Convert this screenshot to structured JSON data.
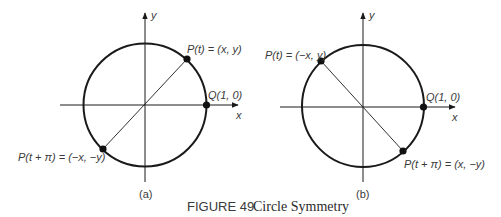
{
  "figure": {
    "number_label": "FIGURE 49",
    "title": "Circle Symmetry"
  },
  "panels": [
    {
      "id": "a",
      "caption": "(a)",
      "x_axis_label": "x",
      "y_axis_label": "y",
      "q_point_label": "Q(1, 0)",
      "p_point_label": "P(t) = (x, y)",
      "p_opposite_label": "P(t + π) = (−x, −y)"
    },
    {
      "id": "b",
      "caption": "(b)",
      "x_axis_label": "x",
      "y_axis_label": "y",
      "q_point_label": "Q(1, 0)",
      "p_point_label": "P(t) = (−x, y)",
      "p_opposite_label": "P(t + π) = (x, −y)"
    }
  ],
  "colors": {
    "stroke": "#1a1a1a",
    "text": "#3a3a3a"
  }
}
